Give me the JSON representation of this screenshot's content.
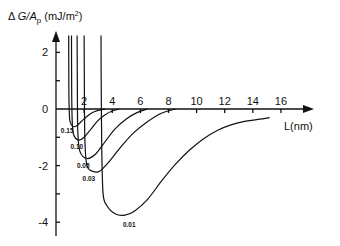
{
  "chart_data": {
    "type": "line",
    "title": "",
    "ylabel": "ΔG/A_p (mJ/m²)",
    "ylabel_parts": {
      "delta": "Δ",
      "G": "G/A",
      "sub": "p",
      "unit": " (mJ/m",
      "sup": "2",
      "close": ")"
    },
    "xlabel": "L(nm)",
    "xlim": [
      0,
      18
    ],
    "ylim": [
      -4.5,
      2.7
    ],
    "x_ticks": [
      2,
      4,
      6,
      8,
      10,
      12,
      14,
      16
    ],
    "x_tick_labels": [
      "2",
      "4",
      "6",
      "8",
      "10",
      "12",
      "14",
      "16"
    ],
    "y_ticks": [
      2,
      1,
      0,
      -1,
      -2,
      -3,
      -4
    ],
    "y_tick_labels": {
      "2": "2",
      "0": "0",
      "-2": "-2",
      "-4": "-4"
    },
    "grid": false,
    "legend": "inline curve labels",
    "series": [
      {
        "name": "0.15",
        "x": [
          0.9,
          0.92,
          0.95,
          1.0,
          1.2,
          1.5,
          2.0,
          2.5,
          3.0,
          3.5
        ],
        "y": [
          2.6,
          0.5,
          -0.2,
          -0.45,
          -0.62,
          -0.58,
          -0.35,
          -0.15,
          -0.05,
          0.0
        ]
      },
      {
        "name": "0.10",
        "x": [
          1.1,
          1.12,
          1.15,
          1.25,
          1.6,
          2.0,
          2.5,
          3.0,
          3.5,
          4.0,
          4.5
        ],
        "y": [
          2.6,
          0.5,
          -0.4,
          -0.9,
          -1.1,
          -1.0,
          -0.7,
          -0.4,
          -0.2,
          -0.07,
          0.0
        ]
      },
      {
        "name": "0.05",
        "x": [
          1.5,
          1.52,
          1.55,
          1.7,
          2.2,
          2.8,
          3.5,
          4.2,
          5.0,
          5.8,
          6.5
        ],
        "y": [
          2.6,
          0.5,
          -0.8,
          -1.5,
          -1.75,
          -1.6,
          -1.15,
          -0.7,
          -0.35,
          -0.12,
          0.0
        ]
      },
      {
        "name": "0.03",
        "x": [
          2.0,
          2.02,
          2.06,
          2.2,
          2.6,
          3.1,
          3.8,
          4.6,
          5.5,
          6.5,
          7.5,
          8.5
        ],
        "y": [
          2.6,
          0.5,
          -1.2,
          -2.0,
          -2.2,
          -2.2,
          -1.85,
          -1.35,
          -0.85,
          -0.45,
          -0.15,
          0.0
        ]
      },
      {
        "name": "0.01",
        "x": [
          3.2,
          3.22,
          3.26,
          3.35,
          3.6,
          4.2,
          4.9,
          5.6,
          6.5,
          7.5,
          8.5,
          9.5,
          10.5,
          11.5,
          12.5,
          13.5,
          14.5,
          15.2
        ],
        "y": [
          2.6,
          0.5,
          -1.5,
          -3.0,
          -3.4,
          -3.7,
          -3.75,
          -3.6,
          -3.2,
          -2.55,
          -1.95,
          -1.45,
          -1.05,
          -0.75,
          -0.55,
          -0.43,
          -0.36,
          -0.3
        ]
      }
    ]
  }
}
